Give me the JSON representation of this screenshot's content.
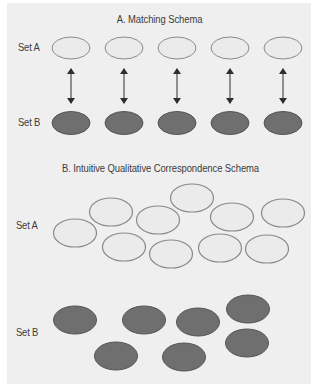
{
  "colors": {
    "background": "#ffffff",
    "panel": "#efefef",
    "light_fill": "#ebebeb",
    "light_stroke": "#8a8a8a",
    "dark_fill": "#6f6f6f",
    "dark_stroke": "#555555",
    "arrow": "#2e2e2e",
    "text": "#3b3b3b"
  },
  "section_a": {
    "title": "A. Matching Schema",
    "set_a_label": "Set A",
    "set_b_label": "Set B",
    "set_a": [
      {
        "cx": 71,
        "cy": 48,
        "rx": 19,
        "ry": 11
      },
      {
        "cx": 124,
        "cy": 48,
        "rx": 19,
        "ry": 11
      },
      {
        "cx": 177,
        "cy": 48,
        "rx": 19,
        "ry": 11
      },
      {
        "cx": 230,
        "cy": 48,
        "rx": 19,
        "ry": 11
      },
      {
        "cx": 283,
        "cy": 48,
        "rx": 19,
        "ry": 11
      }
    ],
    "set_b": [
      {
        "cx": 71,
        "cy": 123,
        "rx": 19,
        "ry": 11.5
      },
      {
        "cx": 124,
        "cy": 123,
        "rx": 19,
        "ry": 11.5
      },
      {
        "cx": 177,
        "cy": 123,
        "rx": 19,
        "ry": 11.5
      },
      {
        "cx": 230,
        "cy": 123,
        "rx": 19,
        "ry": 11.5
      },
      {
        "cx": 283,
        "cy": 123,
        "rx": 19,
        "ry": 11.5
      }
    ],
    "arrows": [
      {
        "x": 71,
        "y1": 69,
        "y2": 103
      },
      {
        "x": 124,
        "y1": 69,
        "y2": 103
      },
      {
        "x": 177,
        "y1": 69,
        "y2": 103
      },
      {
        "x": 230,
        "y1": 69,
        "y2": 103
      },
      {
        "x": 283,
        "y1": 69,
        "y2": 103
      }
    ]
  },
  "section_b": {
    "title": "B. Intuitive Qualitative Correspondence Schema",
    "set_a_label": "Set A",
    "set_b_label": "Set B",
    "set_a": [
      {
        "cx": 75,
        "cy": 233,
        "rx": 21.5,
        "ry": 14
      },
      {
        "cx": 111,
        "cy": 212,
        "rx": 21.5,
        "ry": 14
      },
      {
        "cx": 158,
        "cy": 220,
        "rx": 21.5,
        "ry": 14
      },
      {
        "cx": 192,
        "cy": 198,
        "rx": 21.5,
        "ry": 14
      },
      {
        "cx": 232,
        "cy": 217,
        "rx": 21.5,
        "ry": 14
      },
      {
        "cx": 283,
        "cy": 213,
        "rx": 21.5,
        "ry": 14
      },
      {
        "cx": 124,
        "cy": 247,
        "rx": 21.5,
        "ry": 14
      },
      {
        "cx": 171,
        "cy": 254,
        "rx": 21.5,
        "ry": 14
      },
      {
        "cx": 220,
        "cy": 248,
        "rx": 21.5,
        "ry": 14
      },
      {
        "cx": 267,
        "cy": 249,
        "rx": 21.5,
        "ry": 14
      }
    ],
    "set_b": [
      {
        "cx": 75,
        "cy": 320,
        "rx": 21.5,
        "ry": 14
      },
      {
        "cx": 144,
        "cy": 320,
        "rx": 21.5,
        "ry": 14
      },
      {
        "cx": 198,
        "cy": 322,
        "rx": 21.5,
        "ry": 14
      },
      {
        "cx": 248,
        "cy": 309,
        "rx": 21.5,
        "ry": 14
      },
      {
        "cx": 247,
        "cy": 343,
        "rx": 21.5,
        "ry": 14
      },
      {
        "cx": 116,
        "cy": 356,
        "rx": 21.5,
        "ry": 14
      },
      {
        "cx": 184,
        "cy": 357,
        "rx": 21.5,
        "ry": 14
      }
    ]
  }
}
